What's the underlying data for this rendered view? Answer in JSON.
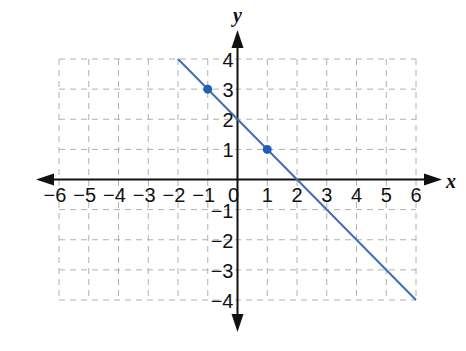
{
  "chart_data": {
    "type": "line",
    "title": "",
    "xlabel": "x",
    "ylabel": "y",
    "xlim": [
      -6,
      6
    ],
    "ylim": [
      -4,
      4
    ],
    "grid": true,
    "grid_style": "dashed",
    "x_ticks": [
      -6,
      -5,
      -4,
      -3,
      -2,
      -1,
      0,
      1,
      2,
      3,
      4,
      5,
      6
    ],
    "y_ticks": [
      -4,
      -3,
      -2,
      -1,
      1,
      2,
      3,
      4
    ],
    "x_tick_labels": [
      "−6",
      "−5",
      "−4",
      "−3",
      "−2",
      "−1",
      "0",
      "1",
      "2",
      "3",
      "4",
      "5",
      "6"
    ],
    "y_tick_labels": [
      "−4",
      "−3",
      "−2",
      "−1",
      "1",
      "2",
      "3",
      "4"
    ],
    "series": [
      {
        "name": "line",
        "equation": "y = -x + 2",
        "color": "#3f6fb0",
        "x": [
          -2,
          6
        ],
        "y": [
          4,
          -4
        ]
      }
    ],
    "points": [
      {
        "x": -1,
        "y": 3,
        "color": "#1f5fb4"
      },
      {
        "x": 1,
        "y": 1,
        "color": "#1f5fb4"
      }
    ],
    "axis_color": "#111111",
    "grid_color": "#b0b0b0"
  }
}
